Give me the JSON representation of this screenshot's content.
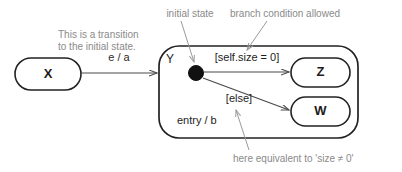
{
  "diagram": {
    "width": 402,
    "height": 172,
    "background_color": "#ffffff",
    "line_color": "#222222",
    "annotation_color": "#8a8a8a",
    "transition_color": "#4a4a4a"
  },
  "states": {
    "source": {
      "label": "X"
    },
    "composite": {
      "label": "Y"
    },
    "target_true": {
      "label": "Z"
    },
    "target_false": {
      "label": "W"
    }
  },
  "pseudostate": {
    "kind": "initial-state-dot"
  },
  "transitions": {
    "incoming": {
      "label": "e / a"
    },
    "branch_true": {
      "label": "[self.size = 0]"
    },
    "branch_false": {
      "label": "[else]"
    }
  },
  "internal_activity": {
    "label": "entry / b"
  },
  "annotations": {
    "transition_note_line1": "This is a transition",
    "transition_note_line2": "to the initial state.",
    "initial_state_note": "initial state",
    "branch_condition_note": "branch condition allowed",
    "else_note": "here equivalent to 'size ≠ 0'"
  }
}
